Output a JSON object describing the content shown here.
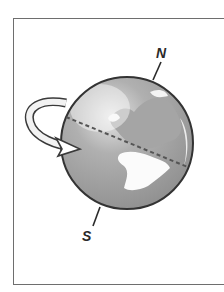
{
  "figure": {
    "labels": {
      "north": "N",
      "south": "S"
    },
    "icons": [
      "globe-icon",
      "rotation-arrow-icon",
      "axis-line",
      "equator-line"
    ],
    "colors": {
      "frame": "#6e6e6e",
      "ocean": "#9a9a9a",
      "land": "#ffffff",
      "outline": "#333333",
      "equator": "#555555"
    }
  }
}
